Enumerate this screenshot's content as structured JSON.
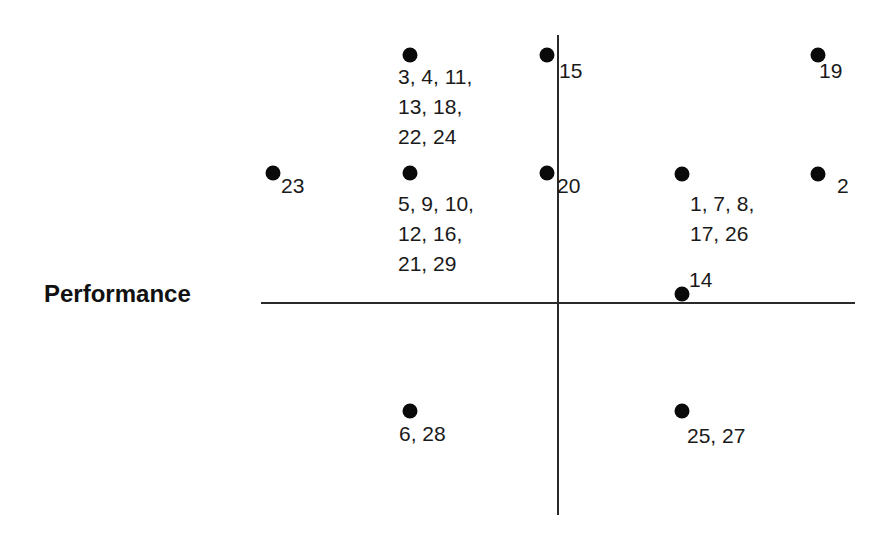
{
  "axis_label": "Performance",
  "colors": {
    "background": "#ffffff",
    "axis": "#2a2a2a",
    "dot": "#0a0a0a",
    "text": "#1a1a1a"
  },
  "points": [
    {
      "id": "p1",
      "x": 410,
      "y": 55,
      "label": "3, 4, 11,\n13, 18,\n22, 24",
      "lx": 398,
      "ly": 62
    },
    {
      "id": "p2",
      "x": 547,
      "y": 55,
      "label": "15",
      "lx": 559,
      "ly": 56
    },
    {
      "id": "p3",
      "x": 818,
      "y": 55,
      "label": "19",
      "lx": 819,
      "ly": 56
    },
    {
      "id": "p4",
      "x": 273,
      "y": 173,
      "label": "23",
      "lx": 281,
      "ly": 171
    },
    {
      "id": "p5",
      "x": 410,
      "y": 173,
      "label": "5, 9, 10,\n12, 16,\n21, 29",
      "lx": 398,
      "ly": 189
    },
    {
      "id": "p6",
      "x": 547,
      "y": 173,
      "label": "20",
      "lx": 557,
      "ly": 171
    },
    {
      "id": "p7",
      "x": 682,
      "y": 174,
      "label": "1, 7, 8,\n17, 26",
      "lx": 690,
      "ly": 189
    },
    {
      "id": "p8",
      "x": 818,
      "y": 174,
      "label": "2",
      "lx": 837,
      "ly": 171
    },
    {
      "id": "p9",
      "x": 682,
      "y": 294,
      "label": "14",
      "lx": 689,
      "ly": 265
    },
    {
      "id": "p10",
      "x": 410,
      "y": 411,
      "label": "6, 28",
      "lx": 399,
      "ly": 419
    },
    {
      "id": "p11",
      "x": 682,
      "y": 411,
      "label": "25, 27",
      "lx": 687,
      "ly": 421
    }
  ],
  "chart_data": {
    "type": "scatter",
    "title": "",
    "xlabel": "",
    "ylabel": "Performance",
    "grid": false,
    "axes": "quadrant (crossing at center)",
    "points": [
      {
        "x": -1,
        "y": 2,
        "labels": [
          3,
          4,
          11,
          13,
          18,
          22,
          24
        ]
      },
      {
        "x": -0.1,
        "y": 2,
        "labels": [
          15
        ]
      },
      {
        "x": 2,
        "y": 2,
        "labels": [
          19
        ]
      },
      {
        "x": -2,
        "y": 1,
        "labels": [
          23
        ]
      },
      {
        "x": -1,
        "y": 1,
        "labels": [
          5,
          9,
          10,
          12,
          16,
          21,
          29
        ]
      },
      {
        "x": -0.1,
        "y": 1,
        "labels": [
          20
        ]
      },
      {
        "x": 1,
        "y": 1,
        "labels": [
          1,
          7,
          8,
          17,
          26
        ]
      },
      {
        "x": 2,
        "y": 1,
        "labels": [
          2
        ]
      },
      {
        "x": 1,
        "y": 0.1,
        "labels": [
          14
        ]
      },
      {
        "x": -1,
        "y": -1,
        "labels": [
          6,
          28
        ]
      },
      {
        "x": 1,
        "y": -1,
        "labels": [
          25,
          27
        ]
      }
    ]
  }
}
